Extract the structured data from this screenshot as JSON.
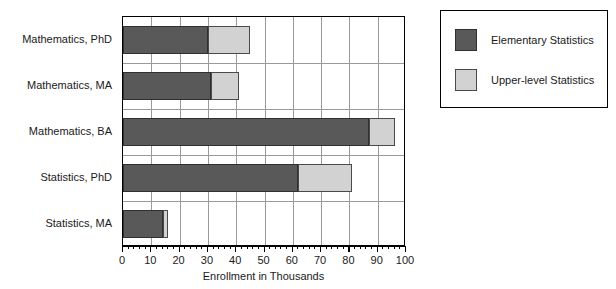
{
  "chart_data": {
    "type": "bar",
    "orientation": "horizontal",
    "stacked": true,
    "title": "",
    "xlabel": "Enrollment in Thousands",
    "ylabel": "",
    "xlim": [
      0,
      100
    ],
    "xticks": [
      0,
      10,
      20,
      30,
      40,
      50,
      60,
      70,
      80,
      90,
      100
    ],
    "xtick_labels": [
      "0",
      "10",
      "20",
      "30",
      "40",
      "50",
      "60",
      "70",
      "80",
      "90",
      "100"
    ],
    "minor_tick_interval": 2,
    "grid": "vertical-and-horizontal",
    "legend_position": "right-outside",
    "categories": [
      "Mathematics, PhD",
      "Mathematics, MA",
      "Mathematics, BA",
      "Statistics, PhD",
      "Statistics, MA"
    ],
    "series": [
      {
        "name": "Elementary Statistics",
        "color": "#595959",
        "values": [
          30,
          31,
          87,
          62,
          14
        ]
      },
      {
        "name": "Upper-level Statistics",
        "color": "#d2d2d2",
        "values": [
          15,
          10,
          9,
          19,
          2
        ]
      }
    ],
    "totals": [
      45,
      41,
      96,
      81,
      16
    ]
  },
  "legend": {
    "entries": [
      {
        "label": "Elementary Statistics"
      },
      {
        "label": "Upper-level Statistics"
      }
    ]
  },
  "colors": {
    "elementary": "#595959",
    "upper_level": "#d2d2d2",
    "frame": "#000000",
    "grid": "#9a9a9a",
    "background": "#ffffff"
  }
}
